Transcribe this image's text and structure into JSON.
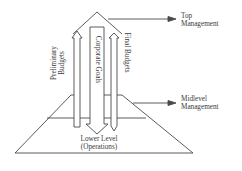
{
  "diagram": {
    "type": "budget-flow-hierarchy",
    "levels": {
      "top": {
        "label_line1": "Top",
        "label_line2": "Management"
      },
      "mid": {
        "label_line1": "Midlevel",
        "label_line2": "Management"
      },
      "lower": {
        "label_line1": "Lower Level",
        "label_line2": "(Operations)"
      }
    },
    "arrows": {
      "preliminary": {
        "label_line1": "Preliminary",
        "label_line2": "Budgets",
        "direction": "up"
      },
      "corporate": {
        "label": "Corporate Goals",
        "direction": "down"
      },
      "final": {
        "label": "Final Budgets",
        "direction": "down"
      }
    },
    "colors": {
      "stroke": "#4a4a4a",
      "text": "#3a3a3a",
      "background": "#ffffff"
    }
  }
}
